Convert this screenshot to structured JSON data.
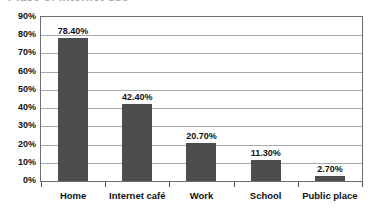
{
  "chart_data": {
    "type": "bar",
    "title": "",
    "title_clipped_fragment": "Place of Internet use",
    "xlabel": "",
    "ylabel": "",
    "categories": [
      "Home",
      "Internet café",
      "Work",
      "School",
      "Public place"
    ],
    "values": [
      78.4,
      42.4,
      20.7,
      11.3,
      2.7
    ],
    "data_labels": [
      "78.40%",
      "42.40%",
      "20.70%",
      "11.30%",
      "2.70%"
    ],
    "ylim": [
      0,
      90
    ],
    "ytick_values": [
      0,
      10,
      20,
      30,
      40,
      50,
      60,
      70,
      80,
      90
    ],
    "ytick_labels": [
      "0%",
      "10%",
      "20%",
      "30%",
      "40%",
      "50%",
      "60%",
      "70%",
      "80%",
      "90%"
    ],
    "grid": true,
    "grid_axis": "y",
    "legend": false,
    "legend_position": "none",
    "bar_color": "#4d4d4d",
    "gridline_color": "#a8a8a8",
    "axis_color": "#6e6e6e",
    "text_color": "#111111",
    "background_color": "#ffffff"
  }
}
